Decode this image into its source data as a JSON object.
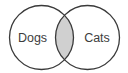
{
  "diagram": {
    "type": "venn",
    "sets": [
      {
        "label": "Dogs",
        "cx": 41.5,
        "cy": 37.5,
        "r": 32
      },
      {
        "label": "Cats",
        "cx": 87.5,
        "cy": 37.5,
        "r": 32
      }
    ],
    "intersection": {
      "shaded": true
    },
    "colors": {
      "stroke": "#3a3a3a",
      "intersection_fill": "#d0d0d0",
      "text": "#3d3d3d",
      "background": "#ffffff"
    }
  }
}
